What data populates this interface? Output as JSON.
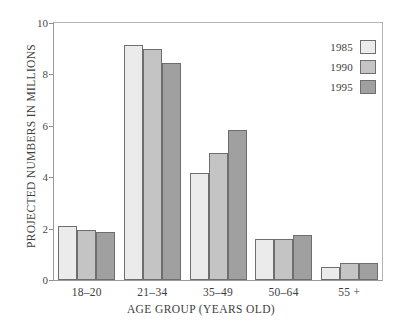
{
  "chart_data": {
    "type": "bar",
    "title": "",
    "xlabel": "AGE GROUP (YEARS OLD)",
    "ylabel": "PROJECTED NUMBERS IN MILLIONS",
    "categories": [
      "18–20",
      "21–34",
      "35–49",
      "50–64",
      "55 +"
    ],
    "series": [
      {
        "name": "1985",
        "color": "#ebebeb",
        "values": [
          2.1,
          9.15,
          4.15,
          1.6,
          0.5
        ]
      },
      {
        "name": "1990",
        "color": "#c4c4c4",
        "values": [
          1.95,
          9.0,
          4.95,
          1.6,
          0.65
        ]
      },
      {
        "name": "1995",
        "color": "#a0a0a0",
        "values": [
          1.85,
          8.45,
          5.85,
          1.75,
          0.65
        ]
      }
    ],
    "ylim": [
      0,
      10
    ],
    "yticks": [
      0,
      2,
      4,
      6,
      8,
      10
    ],
    "ytick_labels": [
      "0",
      "2",
      "4",
      "6",
      "8",
      "10"
    ],
    "grid": false,
    "legend_position": "top-right",
    "bar_border_color": "#6e6e6e",
    "axis_color": "#9a9a9a",
    "background": "#ffffff"
  },
  "legend": {
    "entries": [
      {
        "label": "1985",
        "color": "#ebebeb"
      },
      {
        "label": "1990",
        "color": "#c4c4c4"
      },
      {
        "label": "1995",
        "color": "#a0a0a0"
      }
    ]
  }
}
